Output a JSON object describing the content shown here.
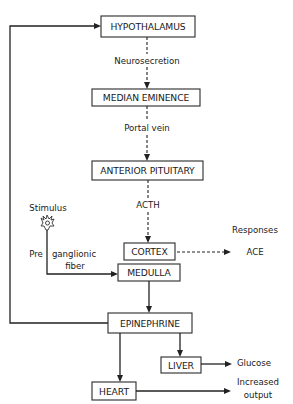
{
  "diagram": {
    "type": "flowchart",
    "nodes": {
      "hypothalamus": "HYPOTHALAMUS",
      "median_eminence": "MEDIAN EMINENCE",
      "anterior_pituitary": "ANTERIOR PITUITARY",
      "cortex": "CORTEX",
      "medulla": "MEDULLA",
      "epinephrine": "EPINEPHRINE",
      "liver": "LIVER",
      "heart": "HEART"
    },
    "edge_labels": {
      "neurosecretion": "Neurosecretion",
      "portal_vein": "Portal vein",
      "acth": "ACTH",
      "stimulus": "Stimulus",
      "pre": "Pre",
      "ganglionic": "ganglionic",
      "fiber": "fiber",
      "responses": "Responses",
      "ace": "ACE",
      "glucose": "Glucose",
      "increased": "Increased",
      "output": "output"
    },
    "edges": [
      {
        "from": "HYPOTHALAMUS",
        "to": "MEDIAN EMINENCE",
        "style": "dashed",
        "label": "Neurosecretion"
      },
      {
        "from": "MEDIAN EMINENCE",
        "to": "ANTERIOR PITUITARY",
        "style": "dashed",
        "label": "Portal vein"
      },
      {
        "from": "ANTERIOR PITUITARY",
        "to": "CORTEX",
        "style": "dashed",
        "label": "ACTH"
      },
      {
        "from": "CORTEX",
        "to": "ACE",
        "style": "dashed",
        "label": "Responses"
      },
      {
        "from": "Stimulus",
        "to": "MEDULLA",
        "style": "solid",
        "label": "Pre ganglionic fiber"
      },
      {
        "from": "MEDULLA",
        "to": "EPINEPHRINE",
        "style": "solid"
      },
      {
        "from": "EPINEPHRINE",
        "to": "HYPOTHALAMUS",
        "style": "solid"
      },
      {
        "from": "EPINEPHRINE",
        "to": "LIVER",
        "style": "solid"
      },
      {
        "from": "EPINEPHRINE",
        "to": "HEART",
        "style": "solid"
      },
      {
        "from": "LIVER",
        "to": "Glucose",
        "style": "solid"
      },
      {
        "from": "HEART",
        "to": "Increased output",
        "style": "solid"
      }
    ]
  }
}
